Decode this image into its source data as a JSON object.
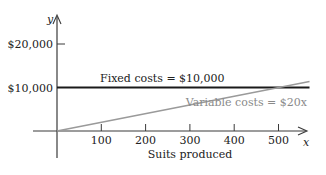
{
  "chart_data": {
    "type": "line",
    "title": "",
    "xlabel": "Suits produced",
    "ylabel": "y",
    "x_axis_symbol": "x",
    "xlim": [
      0,
      570
    ],
    "ylim": [
      0,
      26000
    ],
    "x_ticks": [
      100,
      200,
      300,
      400,
      500
    ],
    "x_tick_labels": [
      "100",
      "200",
      "300",
      "400",
      "500"
    ],
    "y_ticks": [
      10000,
      20000
    ],
    "y_tick_labels": [
      "$10,000",
      "$20,000"
    ],
    "grid": false,
    "legend": "inline labels",
    "series": [
      {
        "name": "Fixed costs",
        "label": "Fixed costs = $10,000",
        "color": "#1a1a1a",
        "x": [
          0,
          570
        ],
        "values": [
          10000,
          10000
        ]
      },
      {
        "name": "Variable costs",
        "label": "Variable costs = $20x",
        "color": "#9a9a9a",
        "x": [
          0,
          570
        ],
        "values": [
          0,
          11400
        ]
      }
    ]
  },
  "colors": {
    "axis": "#3a3a3a",
    "fixed": "#1a1a1a",
    "variable": "#9a9a9a",
    "text": "#222222",
    "variable_text": "#8a8a8a"
  }
}
